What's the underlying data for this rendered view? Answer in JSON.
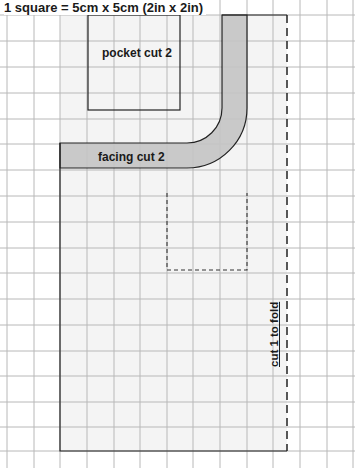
{
  "title": "1 square = 5cm x 5cm (2in x 2in)",
  "pieces": {
    "pocket": {
      "label": "pocket cut 2"
    },
    "facing": {
      "label": "facing cut 2"
    },
    "main": {
      "label": "cut 1 to fold"
    }
  },
  "colors": {
    "grid": "#b8b8b8",
    "piece_fill": "#f4f4f4",
    "facing_fill": "#c4c4c4",
    "outline": "#222222"
  },
  "grid": {
    "cell_px": 26.7,
    "columns": 13,
    "rows": 17
  }
}
